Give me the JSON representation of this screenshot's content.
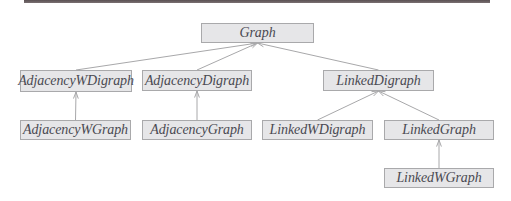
{
  "diagram": {
    "type": "class-hierarchy",
    "nodes": [
      {
        "id": "graph",
        "label": "Graph"
      },
      {
        "id": "adjacency-w-digraph",
        "label": "AdjacencyWDigraph"
      },
      {
        "id": "adjacency-digraph",
        "label": "AdjacencyDigraph"
      },
      {
        "id": "linked-digraph",
        "label": "LinkedDigraph"
      },
      {
        "id": "adjacency-w-graph",
        "label": "AdjacencyWGraph"
      },
      {
        "id": "adjacency-graph",
        "label": "AdjacencyGraph"
      },
      {
        "id": "linked-w-digraph",
        "label": "LinkedWDigraph"
      },
      {
        "id": "linked-graph",
        "label": "LinkedGraph"
      },
      {
        "id": "linked-w-graph",
        "label": "LinkedWGraph"
      }
    ],
    "edges": [
      {
        "from": "adjacency-w-digraph",
        "to": "graph"
      },
      {
        "from": "adjacency-digraph",
        "to": "graph"
      },
      {
        "from": "linked-digraph",
        "to": "graph"
      },
      {
        "from": "adjacency-w-graph",
        "to": "adjacency-w-digraph"
      },
      {
        "from": "adjacency-graph",
        "to": "adjacency-digraph"
      },
      {
        "from": "linked-w-digraph",
        "to": "linked-digraph"
      },
      {
        "from": "linked-graph",
        "to": "linked-digraph"
      },
      {
        "from": "linked-w-graph",
        "to": "linked-graph"
      }
    ]
  }
}
